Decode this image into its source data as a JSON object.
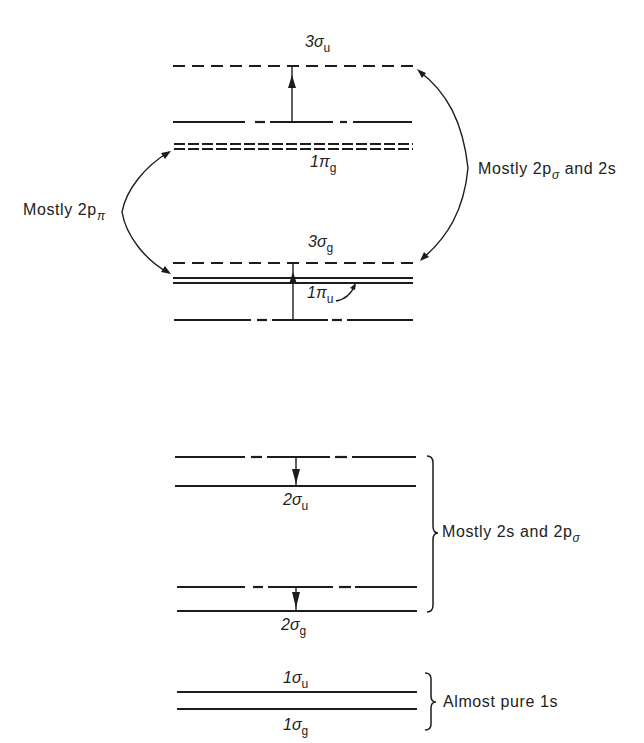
{
  "diagram": {
    "type": "molecular-orbital-energy-level-diagram",
    "levels": [
      {
        "main": "3σ",
        "sub": "u",
        "line_style": "dashed"
      },
      {
        "main": "1π",
        "sub": "g",
        "line_style": "double-dashed"
      },
      {
        "main": "3σ",
        "sub": "g",
        "line_style": "dashed"
      },
      {
        "main": "1π",
        "sub": "u",
        "line_style": "double-solid"
      },
      {
        "main": "2σ",
        "sub": "u",
        "line_style": "solid"
      },
      {
        "main": "2σ",
        "sub": "g",
        "line_style": "solid"
      },
      {
        "main": "1σ",
        "sub": "u",
        "line_style": "solid"
      },
      {
        "main": "1σ",
        "sub": "g",
        "line_style": "solid"
      }
    ],
    "annotations": {
      "pi_group": {
        "text": "Mostly 2p",
        "sub": "π"
      },
      "sigma_upper_group": {
        "text": "Mostly 2p",
        "sub": "σ",
        "suffix": " and 2s"
      },
      "two_s_group": {
        "text": "Mostly 2s and 2p",
        "sub": "σ"
      },
      "one_s_group": {
        "text": "Almost pure 1s"
      }
    },
    "colors": {
      "ink": "#1c1c1c",
      "background": "#ffffff"
    }
  }
}
